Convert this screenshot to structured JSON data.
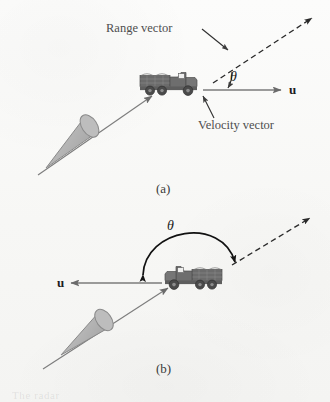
{
  "figure": {
    "background_color": "#fbfbfa",
    "ink_color": "#4a4a4a",
    "shape_fill_color": "#b9b9b9",
    "truck_color": "#6e6e6e",
    "panels": [
      {
        "id": "a",
        "caption": "(a)",
        "labels": {
          "range_vector": "Range vector",
          "velocity_vector": "Velocity vector",
          "velocity_symbol": "u",
          "angle_symbol": "θ"
        },
        "description": "Radar cone at lower left aims up-right at a truck moving right; dashed range vector points up-right from the truck, solid velocity vector points right, angle theta between them."
      },
      {
        "id": "b",
        "caption": "(b)",
        "labels": {
          "velocity_symbol": "u",
          "angle_symbol": "θ"
        },
        "description": "Radar cone at lower left aims up-right at a truck moving left; dashed range vector points up-right, solid velocity vector points left, a large curved double arrow marks the obtuse angle theta."
      }
    ],
    "bleed_text": "The radar"
  }
}
